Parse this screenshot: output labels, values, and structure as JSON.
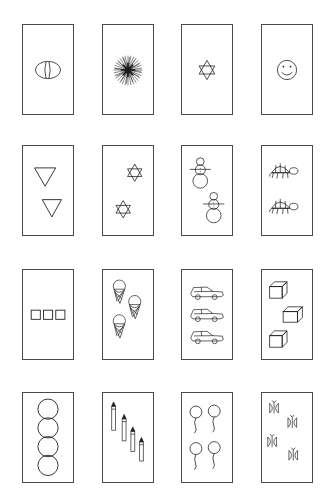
{
  "page": {
    "rows": 4,
    "columns": 4,
    "background_color": "#ffffff",
    "card_border_color": "#4a4a4a",
    "ink_color": "#1a1a1a"
  },
  "cards": [
    {
      "id": "card-1-1",
      "row": 1,
      "column": 1,
      "icon": "egg-icon",
      "label": "egg",
      "count": 1,
      "count_label": "1"
    },
    {
      "id": "card-1-2",
      "row": 1,
      "column": 2,
      "icon": "starburst-icon",
      "label": "starburst",
      "count": 1,
      "count_label": "1"
    },
    {
      "id": "card-1-3",
      "row": 1,
      "column": 3,
      "icon": "six-point-star-icon",
      "label": "six-pointed star",
      "count": 1,
      "count_label": "1"
    },
    {
      "id": "card-1-4",
      "row": 1,
      "column": 4,
      "icon": "smiley-face-icon",
      "label": "smiley face",
      "count": 1,
      "count_label": "1"
    },
    {
      "id": "card-2-1",
      "row": 2,
      "column": 1,
      "icon": "triangle-down-icon",
      "label": "downward triangle",
      "count": 2,
      "count_label": "2"
    },
    {
      "id": "card-2-2",
      "row": 2,
      "column": 2,
      "icon": "six-point-star-icon",
      "label": "six-pointed star",
      "count": 2,
      "count_label": "2"
    },
    {
      "id": "card-2-3",
      "row": 2,
      "column": 3,
      "icon": "snowman-icon",
      "label": "snowman",
      "count": 2,
      "count_label": "2"
    },
    {
      "id": "card-2-4",
      "row": 2,
      "column": 4,
      "icon": "turtle-icon",
      "label": "turtle",
      "count": 2,
      "count_label": "2"
    },
    {
      "id": "card-3-1",
      "row": 3,
      "column": 1,
      "icon": "square-icon",
      "label": "square",
      "count": 3,
      "count_label": "3"
    },
    {
      "id": "card-3-2",
      "row": 3,
      "column": 2,
      "icon": "ice-cream-cone-icon",
      "label": "ice cream cone",
      "count": 3,
      "count_label": "3"
    },
    {
      "id": "card-3-3",
      "row": 3,
      "column": 3,
      "icon": "car-icon",
      "label": "car",
      "count": 3,
      "count_label": "3"
    },
    {
      "id": "card-3-4",
      "row": 3,
      "column": 4,
      "icon": "cube-icon",
      "label": "cube",
      "count": 3,
      "count_label": "3"
    },
    {
      "id": "card-4-1",
      "row": 4,
      "column": 1,
      "icon": "circle-icon",
      "label": "circle",
      "count": 4,
      "count_label": "4"
    },
    {
      "id": "card-4-2",
      "row": 4,
      "column": 2,
      "icon": "pencil-icon",
      "label": "pencil",
      "count": 4,
      "count_label": "4"
    },
    {
      "id": "card-4-3",
      "row": 4,
      "column": 3,
      "icon": "balloon-icon",
      "label": "balloon",
      "count": 4,
      "count_label": "4"
    },
    {
      "id": "card-4-4",
      "row": 4,
      "column": 4,
      "icon": "butterfly-icon",
      "label": "butterfly",
      "count": 4,
      "count_label": "4"
    }
  ]
}
